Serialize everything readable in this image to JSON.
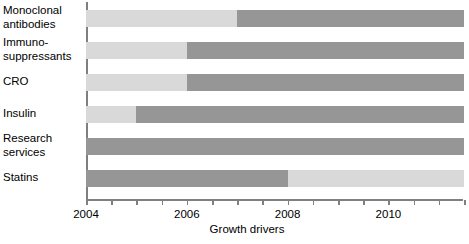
{
  "chart_data": {
    "type": "bar",
    "orientation": "horizontal",
    "title": "",
    "xlabel": "Growth drivers",
    "ylabel": "",
    "xlim": [
      2004,
      2011.5
    ],
    "grid": false,
    "legend": null,
    "colors": {
      "light": "#d9d9d9",
      "dark": "#969696",
      "axis": "#7f7f7f",
      "background": "#ffffff"
    },
    "axis_ticks": [
      {
        "value": 2004,
        "label": "2004",
        "labeled": true
      },
      {
        "value": 2004.5,
        "label": "",
        "labeled": false
      },
      {
        "value": 2005,
        "label": "",
        "labeled": false
      },
      {
        "value": 2005.5,
        "label": "",
        "labeled": false
      },
      {
        "value": 2006,
        "label": "2006",
        "labeled": true
      },
      {
        "value": 2006.5,
        "label": "",
        "labeled": false
      },
      {
        "value": 2007,
        "label": "",
        "labeled": false
      },
      {
        "value": 2007.5,
        "label": "",
        "labeled": false
      },
      {
        "value": 2008,
        "label": "2008",
        "labeled": true
      },
      {
        "value": 2008.5,
        "label": "",
        "labeled": false
      },
      {
        "value": 2009,
        "label": "",
        "labeled": false
      },
      {
        "value": 2009.5,
        "label": "",
        "labeled": false
      },
      {
        "value": 2010,
        "label": "2010",
        "labeled": true
      },
      {
        "value": 2010.5,
        "label": "",
        "labeled": false
      },
      {
        "value": 2011,
        "label": "",
        "labeled": false
      },
      {
        "value": 2011.5,
        "label": "",
        "labeled": false
      }
    ],
    "categories": [
      "Monoclonal\nantibodies",
      "Immuno-\nsuppressants",
      "CRO",
      "Insulin",
      "Research\nservices",
      "Statins"
    ],
    "bars": [
      {
        "category": "Monoclonal\nantibodies",
        "segments": [
          {
            "shade": "light",
            "start": 2004,
            "end": 2007
          },
          {
            "shade": "dark",
            "start": 2007,
            "end": 2011.5
          }
        ]
      },
      {
        "category": "Immuno-\nsuppressants",
        "segments": [
          {
            "shade": "light",
            "start": 2004,
            "end": 2006
          },
          {
            "shade": "dark",
            "start": 2006,
            "end": 2011.5
          }
        ]
      },
      {
        "category": "CRO",
        "segments": [
          {
            "shade": "light",
            "start": 2004,
            "end": 2006
          },
          {
            "shade": "dark",
            "start": 2006,
            "end": 2011.5
          }
        ]
      },
      {
        "category": "Insulin",
        "segments": [
          {
            "shade": "light",
            "start": 2004,
            "end": 2005
          },
          {
            "shade": "dark",
            "start": 2005,
            "end": 2011.5
          }
        ]
      },
      {
        "category": "Research\nservices",
        "segments": [
          {
            "shade": "dark",
            "start": 2004,
            "end": 2011.5
          }
        ]
      },
      {
        "category": "Statins",
        "segments": [
          {
            "shade": "dark",
            "start": 2004,
            "end": 2008
          },
          {
            "shade": "light",
            "start": 2008,
            "end": 2011.5
          }
        ]
      }
    ]
  }
}
